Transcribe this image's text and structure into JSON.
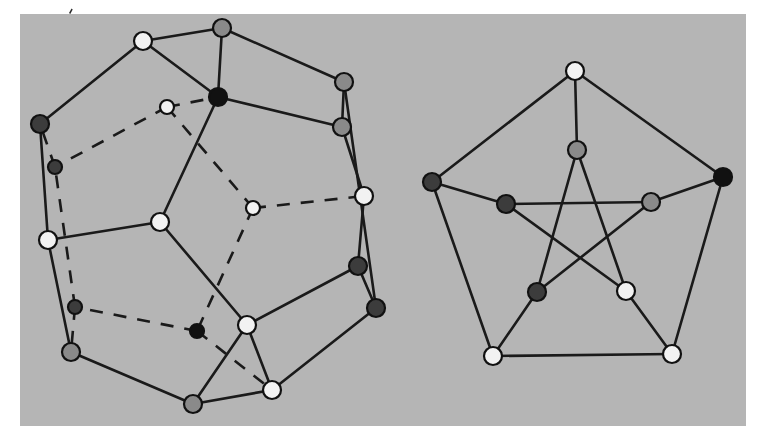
{
  "figure": {
    "canvas": {
      "width": 758,
      "height": 444,
      "background": "#ffffff"
    },
    "panel": {
      "x": 20,
      "y": 14,
      "width": 726,
      "height": 412,
      "fill": "#b5b5b5"
    },
    "speck": {
      "x": 69,
      "y": 9,
      "label": "ink-speck"
    },
    "palette": {
      "white": "#f2f2f2",
      "gray": "#8a8a8a",
      "dark": "#3c3c3c",
      "black": "#111111",
      "edge": "#1a1a1a",
      "node_stroke": "#111111",
      "background": "#b5b5b5"
    },
    "style": {
      "node_radius": 9,
      "node_radius_small": 7,
      "edge_width": 2.6,
      "dash_pattern": "13 11"
    }
  },
  "chart_data": {
    "type": "diagram",
    "graphs": [
      {
        "name": "dodecahedron-graph",
        "label": "Dodecahedron graph",
        "vertex_count": 20,
        "edge_count": 30,
        "nodes": [
          {
            "id": "d0",
            "x": 143,
            "y": 41,
            "color": "white",
            "r": 9
          },
          {
            "id": "d1",
            "x": 222,
            "y": 28,
            "color": "gray",
            "r": 9
          },
          {
            "id": "d2",
            "x": 344,
            "y": 82,
            "color": "gray",
            "r": 9
          },
          {
            "id": "d3",
            "x": 342,
            "y": 127,
            "color": "gray",
            "r": 9
          },
          {
            "id": "d4",
            "x": 364,
            "y": 196,
            "color": "white",
            "r": 9
          },
          {
            "id": "d5",
            "x": 358,
            "y": 266,
            "color": "dark",
            "r": 9
          },
          {
            "id": "d6",
            "x": 376,
            "y": 308,
            "color": "dark",
            "r": 9
          },
          {
            "id": "d7",
            "x": 272,
            "y": 390,
            "color": "white",
            "r": 9
          },
          {
            "id": "d8",
            "x": 193,
            "y": 404,
            "color": "gray",
            "r": 9
          },
          {
            "id": "d9",
            "x": 71,
            "y": 352,
            "color": "gray",
            "r": 9
          },
          {
            "id": "d10",
            "x": 48,
            "y": 240,
            "color": "white",
            "r": 9
          },
          {
            "id": "d11",
            "x": 40,
            "y": 124,
            "color": "dark",
            "r": 9
          },
          {
            "id": "d12",
            "x": 218,
            "y": 97,
            "color": "black",
            "r": 9
          },
          {
            "id": "d13",
            "x": 160,
            "y": 222,
            "color": "white",
            "r": 9
          },
          {
            "id": "d14",
            "x": 247,
            "y": 325,
            "color": "white",
            "r": 9
          },
          {
            "id": "d15",
            "x": 167,
            "y": 107,
            "color": "white",
            "r": 7
          },
          {
            "id": "d16",
            "x": 253,
            "y": 208,
            "color": "white",
            "r": 7
          },
          {
            "id": "d17",
            "x": 197,
            "y": 331,
            "color": "black",
            "r": 7
          },
          {
            "id": "d18",
            "x": 75,
            "y": 307,
            "color": "dark",
            "r": 7
          },
          {
            "id": "d19",
            "x": 55,
            "y": 167,
            "color": "dark",
            "r": 7
          }
        ],
        "edges_solid": [
          [
            "d0",
            "d1"
          ],
          [
            "d1",
            "d2"
          ],
          [
            "d2",
            "d3"
          ],
          [
            "d3",
            "d4"
          ],
          [
            "d4",
            "d5"
          ],
          [
            "d5",
            "d6"
          ],
          [
            "d6",
            "d7"
          ],
          [
            "d7",
            "d8"
          ],
          [
            "d8",
            "d9"
          ],
          [
            "d9",
            "d10"
          ],
          [
            "d10",
            "d11"
          ],
          [
            "d11",
            "d0"
          ],
          [
            "d0",
            "d12"
          ],
          [
            "d1",
            "d12"
          ],
          [
            "d12",
            "d3"
          ],
          [
            "d2",
            "d6"
          ],
          [
            "d12",
            "d13"
          ],
          [
            "d13",
            "d10"
          ],
          [
            "d13",
            "d14"
          ],
          [
            "d14",
            "d5"
          ],
          [
            "d14",
            "d8"
          ],
          [
            "d7",
            "d14"
          ]
        ],
        "edges_dashed": [
          [
            "d15",
            "d12"
          ],
          [
            "d15",
            "d19"
          ],
          [
            "d15",
            "d16"
          ],
          [
            "d16",
            "d4"
          ],
          [
            "d16",
            "d17"
          ],
          [
            "d17",
            "d18"
          ],
          [
            "d17",
            "d7"
          ],
          [
            "d18",
            "d19"
          ],
          [
            "d19",
            "d11"
          ],
          [
            "d18",
            "d9"
          ]
        ]
      },
      {
        "name": "petersen-graph",
        "label": "Petersen graph",
        "vertex_count": 10,
        "edge_count": 15,
        "nodes": [
          {
            "id": "p0",
            "x": 575,
            "y": 71,
            "color": "white",
            "r": 9
          },
          {
            "id": "p1",
            "x": 723,
            "y": 177,
            "color": "black",
            "r": 9
          },
          {
            "id": "p2",
            "x": 672,
            "y": 354,
            "color": "white",
            "r": 9
          },
          {
            "id": "p3",
            "x": 493,
            "y": 356,
            "color": "white",
            "r": 9
          },
          {
            "id": "p4",
            "x": 432,
            "y": 182,
            "color": "dark",
            "r": 9
          },
          {
            "id": "p5",
            "x": 577,
            "y": 150,
            "color": "gray",
            "r": 9
          },
          {
            "id": "p6",
            "x": 651,
            "y": 202,
            "color": "gray",
            "r": 9
          },
          {
            "id": "p7",
            "x": 626,
            "y": 291,
            "color": "white",
            "r": 9
          },
          {
            "id": "p8",
            "x": 537,
            "y": 292,
            "color": "dark",
            "r": 9
          },
          {
            "id": "p9",
            "x": 506,
            "y": 204,
            "color": "dark",
            "r": 9
          }
        ],
        "edges_solid": [
          [
            "p0",
            "p1"
          ],
          [
            "p1",
            "p2"
          ],
          [
            "p2",
            "p3"
          ],
          [
            "p3",
            "p4"
          ],
          [
            "p4",
            "p0"
          ],
          [
            "p0",
            "p5"
          ],
          [
            "p1",
            "p6"
          ],
          [
            "p2",
            "p7"
          ],
          [
            "p3",
            "p8"
          ],
          [
            "p4",
            "p9"
          ],
          [
            "p5",
            "p7"
          ],
          [
            "p7",
            "p9"
          ],
          [
            "p9",
            "p6"
          ],
          [
            "p6",
            "p8"
          ],
          [
            "p8",
            "p5"
          ]
        ],
        "edges_dashed": []
      }
    ]
  }
}
